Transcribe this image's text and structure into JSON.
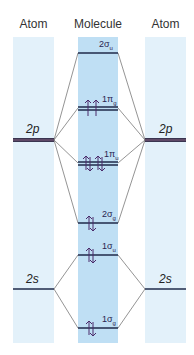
{
  "header": {
    "left": "Atom",
    "center": "Molecule",
    "right": "Atom"
  },
  "atomic_levels": {
    "left_2p": "2p",
    "right_2p": "2p",
    "left_2s": "2s",
    "right_2s": "2s"
  },
  "molecular_orbitals": [
    {
      "name": "2σu",
      "num": "2σ",
      "sub": "u",
      "electrons": 0
    },
    {
      "name": "1πg",
      "num": "1π",
      "sub": "g",
      "electrons": 2
    },
    {
      "name": "1πu",
      "num": "1π",
      "sub": "u",
      "electrons": 4
    },
    {
      "name": "2σg",
      "num": "2σ",
      "sub": "g",
      "electrons": 2
    },
    {
      "name": "1σu",
      "num": "1σ",
      "sub": "u",
      "electrons": 2
    },
    {
      "name": "1σg",
      "num": "1σ",
      "sub": "g",
      "electrons": 2
    }
  ],
  "colors": {
    "atom_band": "#e3f1fa",
    "molecule_band": "#bfdff4",
    "level_line": "#1f2a4a",
    "arrow": "#4a2a6a",
    "connector": "#555555"
  }
}
